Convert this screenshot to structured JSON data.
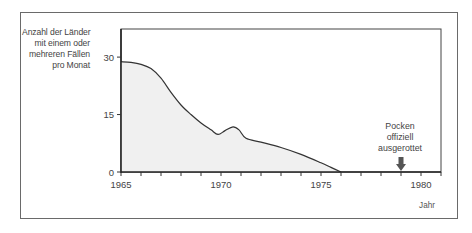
{
  "chart_data": {
    "type": "area",
    "title": "",
    "ylabel_lines": [
      "Anzahl der Länder",
      "mit einem oder",
      "mehreren Fällen",
      "pro Monat"
    ],
    "ylabel": "Anzahl der Länder mit einem oder mehreren Fällen pro Monat",
    "xlabel": "Jahr",
    "xlim": [
      1965,
      1981
    ],
    "ylim": [
      0,
      37
    ],
    "x_ticks": [
      1965,
      1970,
      1975,
      1980
    ],
    "x_minor_ticks": [
      1966,
      1967,
      1968,
      1969,
      1971,
      1972,
      1973,
      1974,
      1976,
      1977,
      1978,
      1979,
      1981
    ],
    "y_ticks": [
      0,
      15,
      30
    ],
    "grid": false,
    "series": [
      {
        "name": "Länder mit Pockenfällen",
        "x": [
          1965,
          1965.5,
          1966,
          1966.5,
          1967,
          1967.5,
          1968,
          1968.5,
          1969,
          1969.5,
          1969.85,
          1970.2,
          1970.6,
          1970.9,
          1971.25,
          1972,
          1973,
          1974,
          1975,
          1975.5,
          1976
        ],
        "y": [
          28.8,
          28.6,
          28.1,
          27.0,
          24.5,
          20.8,
          17.5,
          15.0,
          12.8,
          11.0,
          9.8,
          10.8,
          11.8,
          11.0,
          8.8,
          7.8,
          6.4,
          4.6,
          2.4,
          1.2,
          0
        ]
      }
    ],
    "annotations": [
      {
        "text_lines": [
          "Pocken",
          "offiziell",
          "ausgerottet"
        ],
        "x": 1979,
        "marker": "down-arrow"
      }
    ],
    "colors": {
      "line": "#333333",
      "fill": "#f0f0f0",
      "axis": "#222222",
      "arrow": "#555555",
      "border": "#6a6a6a"
    }
  }
}
